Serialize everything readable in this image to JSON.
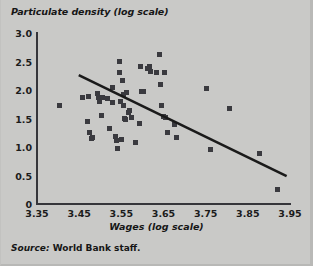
{
  "chart_data": {
    "type": "scatter",
    "title": "Particulate density (log scale)",
    "xlabel": "Wages (log scale)",
    "ylabel": "Particulate density (log scale)",
    "source": "Source: World Bank staff.",
    "source_lead": "Source:",
    "source_body": " World Bank staff.",
    "xlim": [
      3.35,
      3.95
    ],
    "ylim": [
      0,
      3.0
    ],
    "grid": false,
    "legend": null,
    "xticks": [
      "3.35",
      "3.45",
      "3.55",
      "3.65",
      "3.75",
      "3.85",
      "3.95"
    ],
    "xtick_values": [
      3.35,
      3.45,
      3.55,
      3.65,
      3.75,
      3.85,
      3.95
    ],
    "yticks": [
      "0",
      "0.5",
      "1.0",
      "1.5",
      "2.0",
      "2.5",
      "3.0"
    ],
    "ytick_values": [
      0,
      0.5,
      1.0,
      1.5,
      2.0,
      2.5,
      3.0
    ],
    "marker": "square",
    "marker_color": "#3a3a3f",
    "background_color": "#c9c9c7",
    "axis_color": "#35353a",
    "points": [
      [
        3.404,
        1.72
      ],
      [
        3.457,
        1.87
      ],
      [
        3.47,
        1.44
      ],
      [
        3.473,
        1.89
      ],
      [
        3.475,
        1.26
      ],
      [
        3.48,
        1.15
      ],
      [
        3.482,
        1.17
      ],
      [
        3.494,
        1.94
      ],
      [
        3.497,
        1.87
      ],
      [
        3.499,
        1.8
      ],
      [
        3.502,
        1.55
      ],
      [
        3.506,
        1.86
      ],
      [
        3.517,
        1.85
      ],
      [
        3.521,
        1.32
      ],
      [
        3.528,
        2.05
      ],
      [
        3.53,
        1.78
      ],
      [
        3.535,
        1.18
      ],
      [
        3.538,
        1.12
      ],
      [
        3.541,
        0.98
      ],
      [
        3.545,
        2.5
      ],
      [
        3.546,
        2.3
      ],
      [
        3.548,
        1.8
      ],
      [
        3.55,
        1.14
      ],
      [
        3.552,
        2.16
      ],
      [
        3.554,
        1.92
      ],
      [
        3.556,
        1.73
      ],
      [
        3.558,
        1.5
      ],
      [
        3.56,
        1.48
      ],
      [
        3.562,
        1.96
      ],
      [
        3.566,
        1.6
      ],
      [
        3.57,
        1.64
      ],
      [
        3.575,
        1.51
      ],
      [
        3.584,
        1.08
      ],
      [
        3.592,
        1.42
      ],
      [
        3.596,
        2.41
      ],
      [
        3.599,
        1.98
      ],
      [
        3.602,
        1.97
      ],
      [
        3.613,
        2.37
      ],
      [
        3.616,
        2.41
      ],
      [
        3.618,
        2.33
      ],
      [
        3.634,
        2.3
      ],
      [
        3.64,
        2.62
      ],
      [
        3.643,
        2.1
      ],
      [
        3.646,
        1.73
      ],
      [
        3.649,
        1.54
      ],
      [
        3.652,
        2.3
      ],
      [
        3.655,
        1.51
      ],
      [
        3.66,
        1.26
      ],
      [
        3.676,
        1.4
      ],
      [
        3.682,
        1.16
      ],
      [
        3.752,
        2.02
      ],
      [
        3.762,
        0.96
      ],
      [
        3.806,
        1.68
      ],
      [
        3.878,
        0.88
      ],
      [
        3.92,
        0.25
      ]
    ],
    "trendline": {
      "type": "line",
      "x0": 3.449,
      "y0": 2.26,
      "x1": 3.942,
      "y1": 0.49,
      "color": "#1a1a1a",
      "width": 2.6
    }
  }
}
